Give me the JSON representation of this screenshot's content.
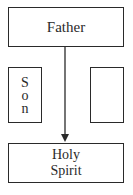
{
  "diagram": {
    "nodes": {
      "father": {
        "label": "Father"
      },
      "son": {
        "label": "Son",
        "letters": [
          "S",
          "o",
          "n"
        ]
      },
      "empty": {
        "label": ""
      },
      "spirit": {
        "line1": "Holy",
        "line2": "Spirit"
      }
    },
    "edges": [
      {
        "from": "father",
        "to": "spirit",
        "type": "arrow"
      }
    ]
  }
}
